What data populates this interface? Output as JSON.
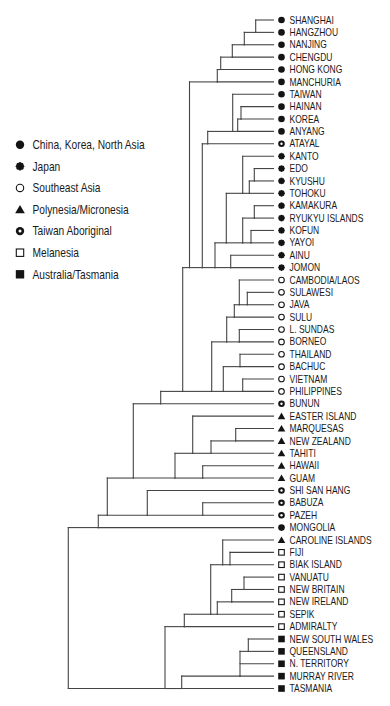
{
  "figure": {
    "background": "#ffffff",
    "line_color": "#454545",
    "marker_color": "#141414",
    "text_color": "#1a1a1a"
  },
  "legend": {
    "items": [
      {
        "group": "china",
        "label": "China, Korea, North Asia",
        "marker": "filled-circle"
      },
      {
        "group": "japan",
        "label": "Japan",
        "marker": "flower"
      },
      {
        "group": "sea",
        "label": "Southeast Asia",
        "marker": "hollow-circle"
      },
      {
        "group": "poly",
        "label": "Polynesia/Micronesia",
        "marker": "filled-triangle"
      },
      {
        "group": "taiwan",
        "label": "Taiwan Aboriginal",
        "marker": "dotted-circle"
      },
      {
        "group": "mel",
        "label": "Melanesia",
        "marker": "hollow-square"
      },
      {
        "group": "aus",
        "label": "Australia/Tasmania",
        "marker": "filled-square"
      }
    ]
  },
  "dendrogram": {
    "leaves": [
      {
        "label": "SHANGHAI",
        "group": "china"
      },
      {
        "label": "HANGZHOU",
        "group": "china"
      },
      {
        "label": "NANJING",
        "group": "china"
      },
      {
        "label": "CHENGDU",
        "group": "china"
      },
      {
        "label": "HONG KONG",
        "group": "china"
      },
      {
        "label": "MANCHURIA",
        "group": "china"
      },
      {
        "label": "TAIWAN",
        "group": "china"
      },
      {
        "label": "HAINAN",
        "group": "china"
      },
      {
        "label": "KOREA",
        "group": "china"
      },
      {
        "label": "ANYANG",
        "group": "china"
      },
      {
        "label": "ATAYAL",
        "group": "taiwan"
      },
      {
        "label": "KANTO",
        "group": "japan"
      },
      {
        "label": "EDO",
        "group": "japan"
      },
      {
        "label": "KYUSHU",
        "group": "japan"
      },
      {
        "label": "TOHOKU",
        "group": "japan"
      },
      {
        "label": "KAMAKURA",
        "group": "japan"
      },
      {
        "label": "RYUKYU ISLANDS",
        "group": "japan"
      },
      {
        "label": "KOFUN",
        "group": "japan"
      },
      {
        "label": "YAYOI",
        "group": "japan"
      },
      {
        "label": "AINU",
        "group": "japan"
      },
      {
        "label": "JOMON",
        "group": "japan"
      },
      {
        "label": "CAMBODIA/LAOS",
        "group": "sea"
      },
      {
        "label": "SULAWESI",
        "group": "sea"
      },
      {
        "label": "JAVA",
        "group": "sea"
      },
      {
        "label": "SULU",
        "group": "sea"
      },
      {
        "label": "L. SUNDAS",
        "group": "sea"
      },
      {
        "label": "BORNEO",
        "group": "sea"
      },
      {
        "label": "THAILAND",
        "group": "sea"
      },
      {
        "label": "BACHUC",
        "group": "sea"
      },
      {
        "label": "VIETNAM",
        "group": "sea"
      },
      {
        "label": "PHILIPPINES",
        "group": "sea"
      },
      {
        "label": "BUNUN",
        "group": "taiwan"
      },
      {
        "label": "EASTER ISLAND",
        "group": "poly"
      },
      {
        "label": "MARQUESAS",
        "group": "poly"
      },
      {
        "label": "NEW ZEALAND",
        "group": "poly"
      },
      {
        "label": "TAHITI",
        "group": "poly"
      },
      {
        "label": "HAWAII",
        "group": "poly"
      },
      {
        "label": "GUAM",
        "group": "poly"
      },
      {
        "label": "SHI SAN HANG",
        "group": "taiwan"
      },
      {
        "label": "BABUZA",
        "group": "taiwan"
      },
      {
        "label": "PAZEH",
        "group": "taiwan"
      },
      {
        "label": "MONGOLIA",
        "group": "china"
      },
      {
        "label": "CAROLINE ISLANDS",
        "group": "poly"
      },
      {
        "label": "FIJI",
        "group": "mel"
      },
      {
        "label": "BIAK ISLAND",
        "group": "mel"
      },
      {
        "label": "VANUATU",
        "group": "mel"
      },
      {
        "label": "NEW BRITAIN",
        "group": "mel"
      },
      {
        "label": "NEW IRELAND",
        "group": "mel"
      },
      {
        "label": "SEPIK",
        "group": "mel"
      },
      {
        "label": "ADMIRALTY",
        "group": "mel"
      },
      {
        "label": "NEW SOUTH WALES",
        "group": "aus"
      },
      {
        "label": "QUEENSLAND",
        "group": "aus"
      },
      {
        "label": "N. TERRITORY",
        "group": "aus"
      },
      {
        "label": "MURRAY RIVER",
        "group": "aus"
      },
      {
        "label": "TASMANIA",
        "group": "aus"
      }
    ],
    "tree": {
      "x": 68.3,
      "children": [
        {
          "x": 98.3,
          "children": [
            {
              "x": 107.3,
              "children": [
                {
                  "x": 133.3,
                  "children": [
                    {
                      "x": 160.7,
                      "children": [
                        {
                          "x": 182.7,
                          "children": [
                            {
                              "x": 189.5,
                              "children": [
                                {
                                  "x": 217.3,
                                  "children": [
                                    {
                                      "x": 220.7,
                                      "children": [
                                        {
                                          "x": 232.3,
                                          "children": [
                                            {
                                              "x": 244.3,
                                              "children": [
                                                {
                                                  "x": 255.7,
                                                  "children": [
                                                    0,
                                                    1
                                                  ]
                                                },
                                                2
                                              ]
                                            },
                                            3
                                          ]
                                        },
                                        4
                                      ]
                                    },
                                    5
                                  ]
                                },
                                {
                                  "x": 202.3,
                                  "children": [
                                    {
                                      "x": 207.7,
                                      "children": [
                                        {
                                          "x": 232.7,
                                          "children": [
                                            6,
                                            {
                                              "x": 237.7,
                                              "children": [
                                                {
                                                  "x": 241,
                                                  "children": [
                                                    7,
                                                    8
                                                  ]
                                                },
                                                9
                                              ]
                                            }
                                          ]
                                        },
                                        10
                                      ]
                                    },
                                    {
                                      "x": 215,
                                      "children": [
                                        {
                                          "x": 226.3,
                                          "children": [
                                            {
                                              "x": 242.7,
                                              "children": [
                                                11,
                                                {
                                                  "x": 249.3,
                                                  "children": [
                                                    {
                                                      "x": 254.3,
                                                      "children": [
                                                        12,
                                                        13
                                                      ]
                                                    },
                                                    14
                                                  ]
                                                }
                                              ]
                                            },
                                            {
                                              "x": 242.7,
                                              "children": [
                                                {
                                                  "x": 254.3,
                                                  "children": [
                                                    15,
                                                    16
                                                  ]
                                                },
                                                {
                                                  "x": 251,
                                                  "children": [
                                                    17,
                                                    18
                                                  ]
                                                }
                                              ]
                                            }
                                          ]
                                        },
                                        {
                                          "x": 230.7,
                                          "children": [
                                            19,
                                            20
                                          ]
                                        }
                                      ]
                                    }
                                  ]
                                }
                              ]
                            },
                            {
                              "x": 211.7,
                              "children": [
                                {
                                  "x": 226.7,
                                  "children": [
                                    {
                                      "x": 234.3,
                                      "children": [
                                        {
                                          "x": 239.3,
                                          "children": [
                                            21,
                                            {
                                              "x": 247.3,
                                              "children": [
                                                22,
                                                23
                                              ]
                                            }
                                          ]
                                        },
                                        24
                                      ]
                                    },
                                    {
                                      "x": 239.3,
                                      "children": [
                                        25,
                                        26
                                      ]
                                    }
                                  ]
                                },
                                {
                                  "x": 223.3,
                                  "children": [
                                    {
                                      "x": 240,
                                      "children": [
                                        27,
                                        28
                                      ]
                                    },
                                    {
                                      "x": 242.7,
                                      "children": [
                                        29,
                                        30
                                      ]
                                    }
                                  ]
                                }
                              ]
                            }
                          ]
                        },
                        31
                      ]
                    },
                    {
                      "x": 175,
                      "children": [
                        {
                          "x": 192.7,
                          "children": [
                            32,
                            {
                              "x": 211,
                              "children": [
                                {
                                  "x": 235.7,
                                  "children": [
                                    33,
                                    34
                                  ]
                                },
                                35
                              ]
                            }
                          ]
                        },
                        {
                          "x": 202.7,
                          "children": [
                            36,
                            37
                          ]
                        }
                      ]
                    }
                  ]
                },
                {
                  "x": 147.3,
                  "children": [
                    38,
                    {
                      "x": 202.7,
                      "children": [
                        39,
                        40
                      ]
                    }
                  ]
                }
              ]
            },
            41
          ]
        },
        {
          "x": 165,
          "children": [
            {
              "x": 184.3,
              "children": [
                {
                  "x": 210.7,
                  "children": [
                    {
                      "x": 222.7,
                      "children": [
                        42,
                        {
                          "x": 230,
                          "children": [
                            43,
                            44
                          ]
                        }
                      ]
                    },
                    {
                      "x": 217.3,
                      "children": [
                        {
                          "x": 231.7,
                          "children": [
                            {
                              "x": 244,
                              "children": [
                                45,
                                46
                              ]
                            },
                            47
                          ]
                        },
                        48
                      ]
                    }
                  ]
                },
                49
              ]
            },
            {
              "x": 181.7,
              "children": [
                {
                  "x": 240,
                  "children": [
                    {
                      "x": 248.3,
                      "children": [
                        50,
                        51
                      ]
                    },
                    52,
                    53
                  ]
                },
                54
              ]
            }
          ]
        }
      ]
    }
  }
}
